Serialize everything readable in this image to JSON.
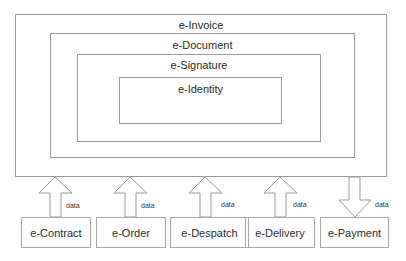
{
  "diagram": {
    "layers": [
      {
        "id": "invoice",
        "label": "e-Invoice"
      },
      {
        "id": "document",
        "label": "e-Document"
      },
      {
        "id": "signature",
        "label": "e-Signature"
      },
      {
        "id": "identity",
        "label": "e-Identity"
      }
    ],
    "sources": [
      {
        "label": "e-Contract",
        "flow": "up",
        "flow_label": "data"
      },
      {
        "label": "e-Order",
        "flow": "up",
        "flow_label": "data"
      },
      {
        "label": "e-Despatch",
        "flow": "up",
        "flow_label": "data"
      },
      {
        "label": "e-Delivery",
        "flow": "up",
        "flow_label": "data"
      },
      {
        "label": "e-Payment",
        "flow": "down",
        "flow_label": "data"
      }
    ],
    "colors": {
      "border": "#9a9a9a",
      "text": "#2a2a2a",
      "arrow": "#9a9a9a"
    }
  }
}
